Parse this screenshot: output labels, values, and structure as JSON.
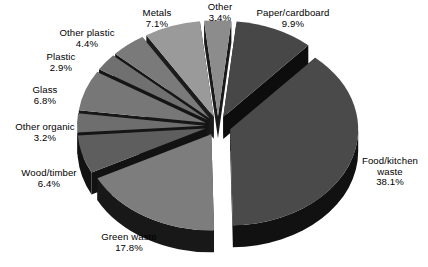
{
  "figure": {
    "background_color": "#ffffff",
    "text_color": "#000000",
    "width": 428,
    "height": 267
  },
  "chart_data": {
    "type": "pie",
    "title": "",
    "subtitle": "",
    "xlabel": "",
    "ylabel": "",
    "units": "percent",
    "exploded": true,
    "three_d": true,
    "legend_position": "none",
    "label_format": "name + percentage",
    "grid": false,
    "total_percent": 99.6,
    "categories": [
      "Paper/cardboard",
      "Food/kitchen waste",
      "Green waste",
      "Wood/timber",
      "Other organic",
      "Glass",
      "Plastic",
      "Other plastic",
      "Metals",
      "Other"
    ],
    "values": [
      9.9,
      38.1,
      17.8,
      6.4,
      3.2,
      6.8,
      2.9,
      4.4,
      7.1,
      3.4
    ],
    "slices": [
      {
        "name": "Paper/cardboard",
        "label_line1": "Paper/cardboard",
        "label_line2": "9.9%",
        "value": 9.9,
        "top_color": "#474747",
        "side_color": "#0d0d0d",
        "label_x": 245,
        "label_y": 8,
        "label_width": 96
      },
      {
        "name": "Food/kitchen waste",
        "label_line1": "Food/kitchen",
        "label_line2": "waste",
        "label_line3": "38.1%",
        "value": 38.1,
        "top_color": "#4a4a4a",
        "side_color": "#111111",
        "label_x": 352,
        "label_y": 156,
        "label_width": 76
      },
      {
        "name": "Green waste",
        "label_line1": "Green waste",
        "label_line2": "17.8%",
        "value": 17.8,
        "top_color": "#7d7d7d",
        "side_color": "#181818",
        "label_x": 86,
        "label_y": 232,
        "label_width": 86
      },
      {
        "name": "Wood/timber",
        "label_line1": "Wood/timber",
        "label_line2": "6.4%",
        "value": 6.4,
        "top_color": "#5e5e5e",
        "side_color": "#121212",
        "label_x": 8,
        "label_y": 168,
        "label_width": 82
      },
      {
        "name": "Other organic",
        "label_line1": "Other organic",
        "label_line2": "3.2%",
        "value": 3.2,
        "top_color": "#6e6e6e",
        "side_color": "#151515",
        "label_x": 2,
        "label_y": 122,
        "label_width": 86
      },
      {
        "name": "Glass",
        "label_line1": "Glass",
        "label_line2": "6.8%",
        "value": 6.8,
        "top_color": "#777777",
        "side_color": "#171717",
        "label_x": 14,
        "label_y": 85,
        "label_width": 62
      },
      {
        "name": "Plastic",
        "label_line1": "Plastic",
        "label_line2": "2.9%",
        "value": 2.9,
        "top_color": "#707070",
        "side_color": "#151515",
        "label_x": 30,
        "label_y": 52,
        "label_width": 62
      },
      {
        "name": "Other plastic",
        "label_line1": "Other plastic",
        "label_line2": "4.4%",
        "value": 4.4,
        "top_color": "#7a7a7a",
        "side_color": "#161616",
        "label_x": 44,
        "label_y": 28,
        "label_width": 86
      },
      {
        "name": "Metals",
        "label_line1": "Metals",
        "label_line2": "7.1%",
        "value": 7.1,
        "top_color": "#9a9a9a",
        "side_color": "#1c1c1c",
        "label_x": 126,
        "label_y": 8,
        "label_width": 62
      },
      {
        "name": "Other",
        "label_line1": "Other",
        "label_line2": "3.4%",
        "value": 3.4,
        "top_color": "#8c8c8c",
        "side_color": "#1a1a1a",
        "label_x": 192,
        "label_y": 2,
        "label_width": 56
      }
    ],
    "geometry": {
      "center_x": 218,
      "center_y": 126,
      "radius_x": 128,
      "radius_y": 96,
      "depth": 22,
      "explode_distance": 13,
      "start_angle_deg": -84,
      "direction": "clockwise"
    }
  }
}
